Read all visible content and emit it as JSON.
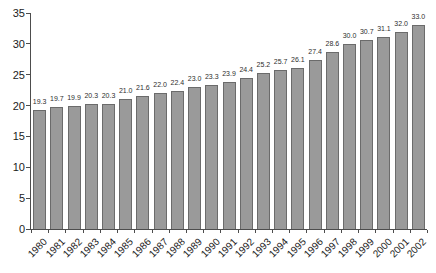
{
  "chart_data": {
    "type": "bar",
    "title": "",
    "xlabel": "",
    "ylabel": "",
    "categories": [
      "1980",
      "1981",
      "1982",
      "1983",
      "1984",
      "1985",
      "1986",
      "1987",
      "1988",
      "1989",
      "1990",
      "1991",
      "1992",
      "1993",
      "1994",
      "1995",
      "1996",
      "1997",
      "1998",
      "1999",
      "2000",
      "2001",
      "2002"
    ],
    "values": [
      19.3,
      19.7,
      19.9,
      20.3,
      20.3,
      21.0,
      21.6,
      22.0,
      22.4,
      23.0,
      23.3,
      23.9,
      24.4,
      25.2,
      25.7,
      26.1,
      27.4,
      28.6,
      30.0,
      30.7,
      31.1,
      32.0,
      33.0
    ],
    "value_labels": [
      "19.3",
      "19.7",
      "19.9",
      "20.3",
      "20.3",
      "21.0",
      "21.6",
      "22.0",
      "22.4",
      "23.0",
      "23.3",
      "23.9",
      "24.4",
      "25.2",
      "25.7",
      "26.1",
      "27.4",
      "28.6",
      "30.0",
      "30.7",
      "31.1",
      "32.0",
      "33.0"
    ],
    "ylim": [
      0,
      35
    ],
    "yticks": [
      0,
      5,
      10,
      15,
      20,
      25,
      30,
      35
    ],
    "grid": false,
    "legend": false,
    "bar_color": "#9a9a9a",
    "bar_border_color": "#6b6b6b",
    "axis_color": "#4d4d4d",
    "text_color": "#1c1c1c"
  }
}
